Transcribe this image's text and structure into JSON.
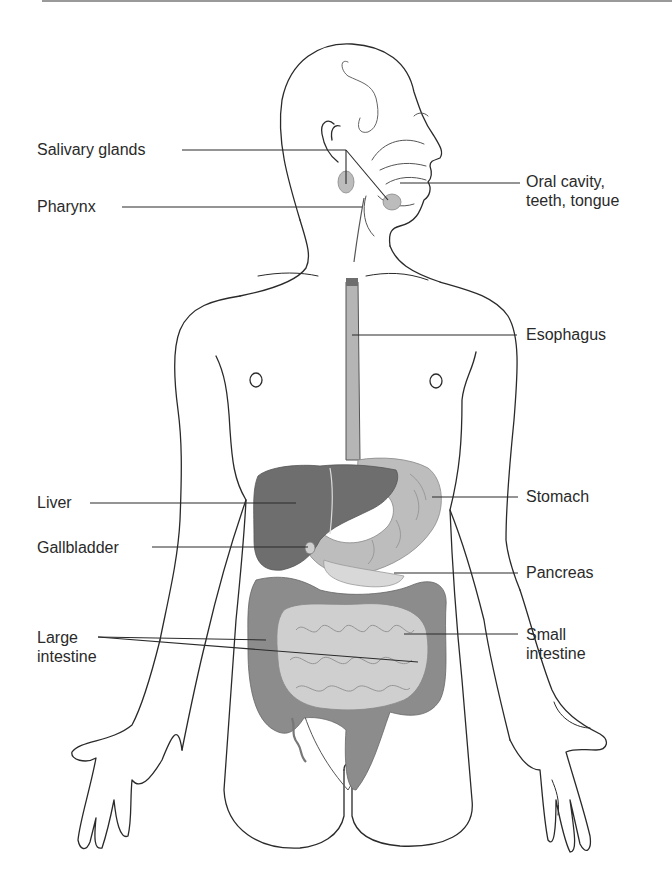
{
  "figure": {
    "colors": {
      "outline": "#2a2a2a",
      "leader_line": "#2a2a2a",
      "liver": "#6e6e6e",
      "stomach": "#bdbdbd",
      "large_intestine": "#8c8c8c",
      "small_intestine": "#cfcfcf",
      "esophagus": "#b5b5b5",
      "pancreas": "#d8d8d8",
      "salivary_glands": "#bcbcbc",
      "top_rule": "#9a9a9a"
    },
    "labels_left": [
      {
        "id": "salivary-glands",
        "text": "Salivary glands"
      },
      {
        "id": "pharynx",
        "text": "Pharynx"
      },
      {
        "id": "liver",
        "text": "Liver"
      },
      {
        "id": "gallbladder",
        "text": "Gallbladder"
      },
      {
        "id": "large-intestine",
        "line1": "Large",
        "line2": "intestine"
      }
    ],
    "labels_right": [
      {
        "id": "oral-cavity",
        "line1": "Oral cavity,",
        "line2": "teeth, tongue"
      },
      {
        "id": "esophagus",
        "text": "Esophagus"
      },
      {
        "id": "stomach",
        "text": "Stomach"
      },
      {
        "id": "pancreas",
        "text": "Pancreas"
      },
      {
        "id": "small-intestine",
        "line1": "Small",
        "line2": "intestine"
      }
    ]
  }
}
